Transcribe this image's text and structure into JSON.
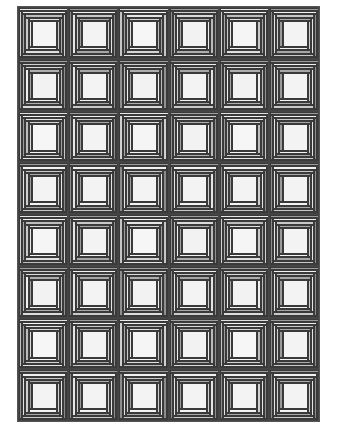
{
  "quilt": {
    "pattern": "log-cabin",
    "columns": 6,
    "rows": 8,
    "colors": {
      "white": "#f4f4f4",
      "light": "#dcdcdc",
      "mid": "#bdbdbd",
      "dark": "#9a9a9a",
      "darker": "#858585",
      "line": "#3a3a3a"
    },
    "block_variants": [
      [
        "#e8e8e8",
        "#c4c4c4",
        "#f2f2f2",
        "#d0d0d0",
        "#bdbdbd",
        "#a8a8a8",
        "#e0e0e0",
        "#c9c9c9",
        "#f5f5f5"
      ],
      [
        "#9a9a9a",
        "#d8d8d8",
        "#f0f0f0",
        "#8c8c8c",
        "#c8c8c8",
        "#e4e4e4",
        "#a6a6a6",
        "#cfcfcf",
        "#f3f3f3"
      ],
      [
        "#dedede",
        "#b0b0b0",
        "#f4f4f4",
        "#c6c6c6",
        "#e6e6e6",
        "#9c9c9c",
        "#d4d4d4",
        "#bcbcbc",
        "#f6f6f6"
      ],
      [
        "#a0a0a0",
        "#e2e2e2",
        "#cfcfcf",
        "#909090",
        "#dadada",
        "#bababa",
        "#aeaeae",
        "#eeeeee",
        "#f2f2f2"
      ]
    ]
  }
}
